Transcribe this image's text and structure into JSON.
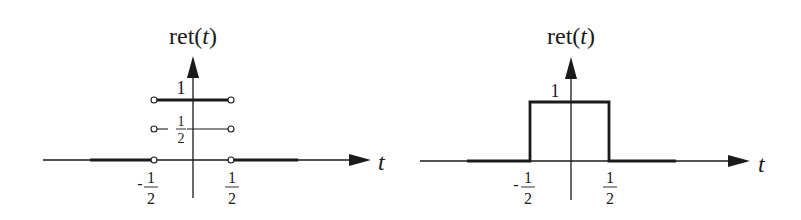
{
  "diagrams": [
    {
      "id": "left",
      "title_prefix": "ret(",
      "title_var": "t",
      "title_suffix": ")",
      "x_axis_label": "t",
      "level_one_label": "1",
      "level_half_label_minus": "−",
      "level_half_num": "1",
      "level_half_den": "2",
      "tick_neg_sign": "-",
      "tick_neg_num": "1",
      "tick_neg_den": "2",
      "tick_pos_num": "1",
      "tick_pos_den": "2",
      "description": "Ambiguous definitions at discontinuities: open circles at t = ±1/2 for values 0, 1/2, 1"
    },
    {
      "id": "right",
      "title_prefix": "ret(",
      "title_var": "t",
      "title_suffix": ")",
      "x_axis_label": "t",
      "level_one_label": "1",
      "tick_neg_sign": "-",
      "tick_neg_num": "1",
      "tick_neg_den": "2",
      "tick_pos_num": "1",
      "tick_pos_den": "2",
      "description": "Rectangle function of height 1 on [-1/2, 1/2]"
    }
  ],
  "colors": {
    "ink": "#1a1a1a",
    "background": "#ffffff"
  }
}
